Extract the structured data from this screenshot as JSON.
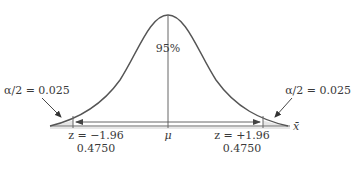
{
  "diagram": {
    "type": "normal-distribution",
    "center_label": "95%",
    "mean_label": "μ",
    "axis_label": "x̄",
    "left_tail": {
      "alpha_label": "α/2 = 0.025",
      "z_label": "z = −1.96",
      "area_label": "0.4750"
    },
    "right_tail": {
      "alpha_label": "α/2 = 0.025",
      "z_label": "z = +1.96",
      "area_label": "0.4750"
    },
    "colors": {
      "curve": "#555555",
      "shade": "#e6e6e6",
      "axis": "#888888",
      "text": "#3a3a3a"
    }
  }
}
